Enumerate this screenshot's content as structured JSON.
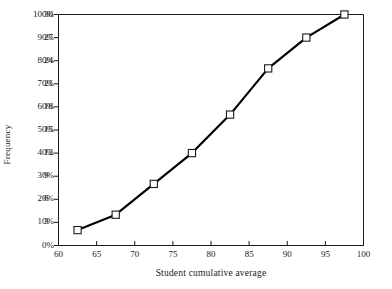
{
  "chart_data": {
    "type": "line",
    "title": "",
    "subtitle": "",
    "xlabel": "Student cumulative average",
    "ylabel": "Frequency",
    "xlim": [
      60,
      100
    ],
    "ylim": [
      0,
      30
    ],
    "grid": false,
    "legend": "none",
    "marker": "open-square",
    "line_color": "#000000",
    "marker_fill": "#ffffff",
    "x": [
      62.5,
      67.5,
      72.5,
      77.5,
      82.5,
      87.5,
      92.5,
      97.5
    ],
    "values": [
      2,
      4,
      8,
      12,
      17,
      23,
      27,
      30
    ],
    "series": [
      {
        "name": "Cumulative frequency",
        "values": [
          2,
          4,
          8,
          12,
          17,
          23,
          27,
          30
        ],
        "percent_values": [
          6.7,
          13.3,
          26.7,
          40.0,
          56.7,
          76.7,
          90.0,
          100.0
        ]
      }
    ],
    "x_ticks": [
      "60",
      "65",
      "70",
      "75",
      "80",
      "85",
      "90",
      "95",
      "100"
    ],
    "x_tick_values": [
      60,
      65,
      70,
      75,
      80,
      85,
      90,
      95,
      100
    ],
    "y_ticks_percent": [
      "0%",
      "10%",
      "20%",
      "30%",
      "40%",
      "50%",
      "60%",
      "70%",
      "80%",
      "90%",
      "100%"
    ],
    "y_tick_percent_values": [
      0,
      10,
      20,
      30,
      40,
      50,
      60,
      70,
      80,
      90,
      100
    ],
    "y_ticks_count": [
      "3",
      "6",
      "9",
      "12",
      "15",
      "18",
      "21",
      "24",
      "27",
      "30"
    ],
    "y_tick_count_values": [
      3,
      6,
      9,
      12,
      15,
      18,
      21,
      24,
      27,
      30
    ]
  }
}
